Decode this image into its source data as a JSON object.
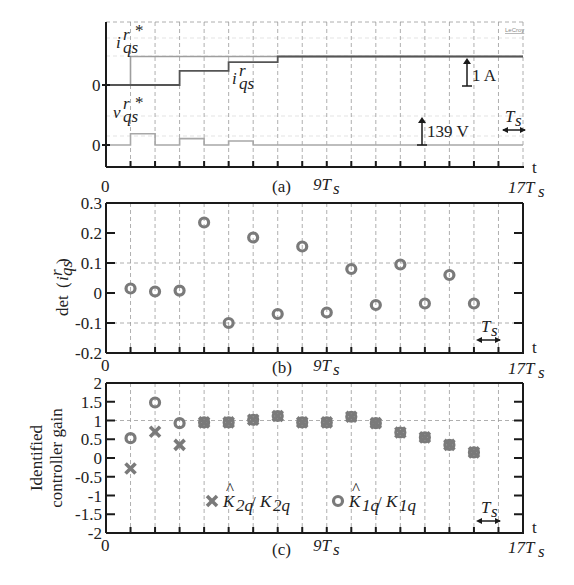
{
  "chart_data": [
    {
      "type": "line",
      "panel_label": "(a)",
      "title": "",
      "xlabel": "t",
      "x_tick_labels": [
        "0",
        "9Ts",
        "17Ts"
      ],
      "xlim": [
        0,
        17
      ],
      "x_unit": "Ts",
      "annotations": {
        "current_scale": "1 A",
        "voltage_scale": "139 V",
        "period_marker": "Ts",
        "scope_brand": "LeCroy"
      },
      "y_zero_labels": [
        "0",
        "0"
      ],
      "series": [
        {
          "name": "i_qs^r*",
          "label": "iqs r *",
          "x": [
            0,
            1,
            1,
            17
          ],
          "values": [
            0,
            0,
            1.0,
            1.0
          ]
        },
        {
          "name": "i_qs^r",
          "label": "iqs r",
          "x": [
            0,
            3,
            3,
            5,
            5,
            7,
            7,
            17
          ],
          "values": [
            0,
            0,
            0.5,
            0.5,
            0.8,
            0.8,
            1.0,
            1.0
          ]
        },
        {
          "name": "v_qs^r*",
          "label": "vqs r *",
          "x": [
            0,
            1,
            1,
            2,
            2,
            3,
            3,
            4,
            4,
            5,
            5,
            6,
            6,
            17
          ],
          "values": [
            0,
            0,
            0.14,
            0.14,
            0,
            0,
            0.08,
            0.08,
            0,
            0,
            0.05,
            0.05,
            0,
            0
          ]
        }
      ]
    },
    {
      "type": "scatter",
      "panel_label": "(b)",
      "ylabel": "det(iqs r)",
      "xlabel": "t",
      "x_tick_labels": [
        "0",
        "9Ts",
        "17Ts"
      ],
      "xlim": [
        0,
        17
      ],
      "ylim": [
        -0.2,
        0.3
      ],
      "y_ticks": [
        "-0.2",
        "-0.1",
        "0",
        "0.1",
        "0.2",
        "0.3"
      ],
      "annotations": {
        "period_marker": "Ts"
      },
      "series": [
        {
          "name": "det(i_qs^r)",
          "marker": "circle",
          "x": [
            1,
            2,
            3,
            4,
            5,
            6,
            7,
            8,
            9,
            10,
            11,
            12,
            13,
            14,
            15
          ],
          "values": [
            0.015,
            0.005,
            0.008,
            0.235,
            -0.1,
            0.185,
            -0.07,
            0.155,
            -0.065,
            0.08,
            -0.04,
            0.095,
            -0.035,
            0.06,
            -0.035
          ]
        }
      ]
    },
    {
      "type": "scatter",
      "panel_label": "(c)",
      "ylabel_lines": [
        "Identified",
        "controller gain"
      ],
      "xlabel": "t",
      "x_tick_labels": [
        "0",
        "9Ts",
        "17Ts"
      ],
      "xlim": [
        0,
        17
      ],
      "ylim": [
        -2,
        2
      ],
      "y_ticks": [
        "-2",
        "-1.5",
        "-1",
        "-0.5",
        "0",
        "0.5",
        "1",
        "1.5",
        "2"
      ],
      "annotations": {
        "period_marker": "Ts"
      },
      "legend": {
        "placement": "bottom-center",
        "entries": [
          "K̂2q / K2q",
          "K̂1q / K1q"
        ]
      },
      "series": [
        {
          "name": "K2q_hat/K2q",
          "marker": "x",
          "x": [
            1,
            2,
            3,
            4,
            5,
            6,
            7,
            8,
            9,
            10,
            11,
            12,
            13,
            14,
            15
          ],
          "values": [
            -0.28,
            0.7,
            0.35,
            0.95,
            0.95,
            1.02,
            1.12,
            0.95,
            0.95,
            1.1,
            0.93,
            0.68,
            0.55,
            0.35,
            0.15
          ]
        },
        {
          "name": "K1q_hat/K1q",
          "marker": "circle",
          "x": [
            1,
            2,
            3,
            4,
            5,
            6,
            7,
            8,
            9,
            10,
            11,
            12,
            13,
            14,
            15
          ],
          "values": [
            0.53,
            1.48,
            0.93,
            0.95,
            0.95,
            1.02,
            1.12,
            0.95,
            0.95,
            1.1,
            0.93,
            0.68,
            0.55,
            0.35,
            0.15
          ]
        }
      ]
    }
  ]
}
